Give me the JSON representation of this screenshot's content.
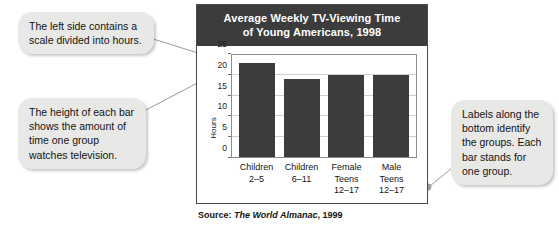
{
  "chart_data": {
    "type": "bar",
    "title": "Average Weekly TV-Viewing Time of Young Americans, 1998",
    "title_line1": "Average Weekly TV-Viewing Time",
    "title_line2": "of Young Americans, 1998",
    "categories": [
      "Children 2–5",
      "Children 6–11",
      "Female Teens 12–17",
      "Male Teens 12–17"
    ],
    "category_lines": [
      [
        "Children",
        "2–5"
      ],
      [
        "Children",
        "6–11"
      ],
      [
        "Female",
        "Teens",
        "12–17"
      ],
      [
        "Male",
        "Teens",
        "12–17"
      ]
    ],
    "values": [
      23,
      19,
      20,
      20
    ],
    "xlabel": "",
    "ylabel": "Hours",
    "ylim": [
      0,
      25
    ],
    "yticks": [
      0,
      5,
      10,
      15,
      20,
      25
    ],
    "ytick_labels": [
      "0",
      "5",
      "10",
      "15",
      "20",
      "25"
    ],
    "grid": true,
    "legend": "none",
    "bar_color": "#3c3c3c",
    "title_band_color": "#3c3c3c",
    "gridline_color": "#cfcfcf"
  },
  "source": {
    "prefix": "Source: ",
    "title": "The World Almanac",
    "suffix": ", 1999"
  },
  "callouts": [
    {
      "id": "scale",
      "text": "The left side contains a scale divided into hours."
    },
    {
      "id": "height",
      "text": "The height of each bar shows the amount of time one group watches television."
    },
    {
      "id": "labels",
      "text": "Labels along the bottom identify the groups. Each bar stands for one group."
    }
  ]
}
